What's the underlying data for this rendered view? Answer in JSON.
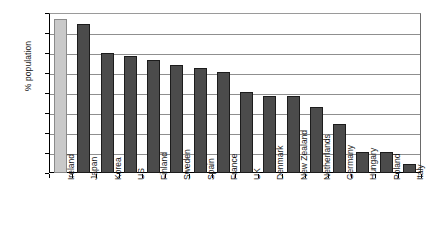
{
  "chart_data": {
    "type": "bar",
    "title": "",
    "xlabel": "",
    "ylabel": "% population",
    "ylim": [
      10,
      50
    ],
    "ytick_step": 5,
    "yticks": [
      "50",
      "45",
      "40",
      "35",
      "30",
      "25",
      "20",
      "15",
      "10"
    ],
    "grid": true,
    "legend": "none",
    "categories": [
      "Ireland",
      "Japan",
      "Korea",
      "US",
      "Finland",
      "Sweden",
      "Spain",
      "France",
      "UK",
      "Denmark",
      "New Zealand",
      "Netherlands",
      "Germany",
      "Hungary",
      "Poland",
      "Italy"
    ],
    "values": [
      48.4,
      47.2,
      40.1,
      39.3,
      38.2,
      37.1,
      36.3,
      35.2,
      30.2,
      29.3,
      29.3,
      26.4,
      22.2,
      15.2,
      15.2,
      12.3
    ],
    "bar_colors": [
      "#c9c9c9",
      "#4b4b4b",
      "#4b4b4b",
      "#4b4b4b",
      "#4b4b4b",
      "#4b4b4b",
      "#4b4b4b",
      "#4b4b4b",
      "#4b4b4b",
      "#4b4b4b",
      "#4b4b4b",
      "#4b4b4b",
      "#4b4b4b",
      "#4b4b4b",
      "#4b4b4b",
      "#4b4b4b"
    ],
    "highlight_category": "Ireland",
    "colors": {
      "highlight": "#c9c9c9",
      "bar": "#4b4b4b",
      "gridline": "#8f8f8f",
      "axis": "#000000",
      "text": "#1a1a1a",
      "background": "#ffffff"
    }
  }
}
